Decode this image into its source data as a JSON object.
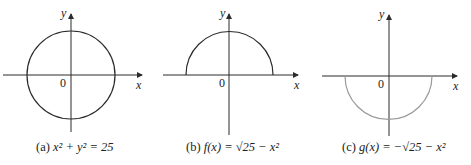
{
  "panels": [
    {
      "id": "a",
      "caption_prefix": "(a)",
      "caption": "x² + y² = 25",
      "x_label": "x",
      "y_label": "y",
      "origin_label": "0",
      "curve": "full circle",
      "curve_color": "#2b2b2b"
    },
    {
      "id": "b",
      "caption_prefix": "(b)",
      "caption": "f(x) = √25 − x²",
      "x_label": "x",
      "y_label": "y",
      "origin_label": "0",
      "curve": "upper semicircle",
      "curve_color": "#2b2b2b"
    },
    {
      "id": "c",
      "caption_prefix": "(c)",
      "caption": "g(x) = −√25 − x²",
      "x_label": "x",
      "y_label": "y",
      "origin_label": "0",
      "curve": "lower semicircle",
      "curve_color": "#9a9a9a"
    }
  ],
  "colors": {
    "axis": "#2b2b2b",
    "text": "#222222"
  }
}
